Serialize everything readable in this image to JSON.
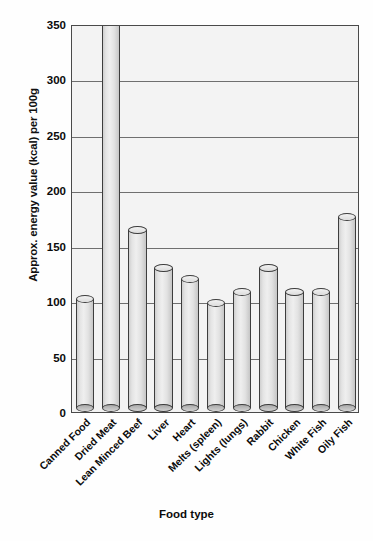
{
  "chart_data": {
    "type": "bar",
    "title": "",
    "xlabel": "Food type",
    "ylabel": "Approx. energy value (kcal) per 100g",
    "categories": [
      "Canned Food",
      "Dried Meat",
      "Lean Minced Beef",
      "Liver",
      "Heart",
      "Melts (spleen)",
      "Lights (lungs)",
      "Rabbit",
      "Chicken",
      "White Fish",
      "Oily Fish"
    ],
    "values": [
      102,
      350,
      164,
      130,
      120,
      98,
      108,
      130,
      108,
      108,
      176
    ],
    "value_notes": {
      "Dried Meat": "bar is clipped at the top of the axis (>= 350)"
    },
    "ylim": [
      0,
      350
    ],
    "yticks": [
      0,
      50,
      100,
      150,
      200,
      250,
      300,
      350
    ],
    "ytick_labels": [
      "0",
      "50",
      "100",
      "150",
      "200",
      "250",
      "300",
      "350"
    ],
    "grid": true,
    "grid_axis": "y",
    "legend": false,
    "bar_style": "cylinder",
    "colors": {
      "bar_fill": "#e4e4e4",
      "bar_outline": "#3d3d3d",
      "plot_background": "#f3f3f3",
      "gridline": "#6f6f6f",
      "text": "#0b0b0b"
    }
  }
}
